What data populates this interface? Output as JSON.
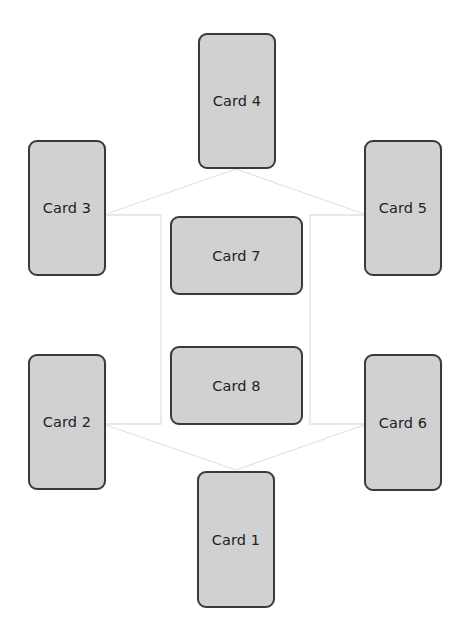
{
  "diagram": {
    "type": "card-layout-graph",
    "background": "#ffffff",
    "card_fill": "#d1d1d1",
    "card_border": "#3a3a3a",
    "connector_color": "#e2e2e2",
    "cards": [
      {
        "id": "card1",
        "label": "Card 1",
        "x": 197,
        "y": 471,
        "w": 78,
        "h": 137
      },
      {
        "id": "card2",
        "label": "Card 2",
        "x": 28,
        "y": 354,
        "w": 78,
        "h": 136
      },
      {
        "id": "card3",
        "label": "Card 3",
        "x": 28,
        "y": 140,
        "w": 78,
        "h": 136
      },
      {
        "id": "card4",
        "label": "Card 4",
        "x": 198,
        "y": 33,
        "w": 78,
        "h": 136
      },
      {
        "id": "card5",
        "label": "Card 5",
        "x": 364,
        "y": 140,
        "w": 78,
        "h": 136
      },
      {
        "id": "card6",
        "label": "Card 6",
        "x": 364,
        "y": 354,
        "w": 78,
        "h": 137
      },
      {
        "id": "card7",
        "label": "Card 7",
        "x": 170,
        "y": 216,
        "w": 133,
        "h": 79
      },
      {
        "id": "card8",
        "label": "Card 8",
        "x": 170,
        "y": 346,
        "w": 133,
        "h": 79
      }
    ],
    "connectors": [
      {
        "from": "card4",
        "to": "card3",
        "points": "236,169 106,214"
      },
      {
        "from": "card4",
        "to": "card5",
        "points": "236,169 364,214"
      },
      {
        "from": "card3",
        "to": "card2",
        "points": "106,215 161,215 161,424 106,424"
      },
      {
        "from": "card5",
        "to": "card6",
        "points": "364,215 310,215 310,424 364,424"
      },
      {
        "from": "card2",
        "to": "card1",
        "points": "106,425 236,470"
      },
      {
        "from": "card6",
        "to": "card1",
        "points": "364,425 236,470"
      }
    ]
  }
}
